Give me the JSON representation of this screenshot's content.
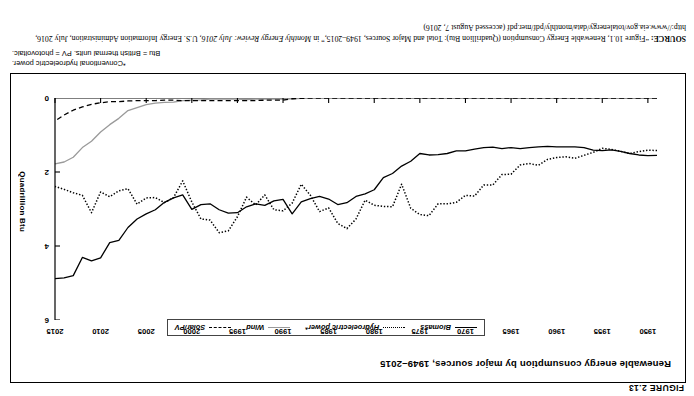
{
  "figure": {
    "number": "FIGURE 2.13"
  },
  "chart": {
    "title": "Renewable energy consumption by major sources, 1949–2015",
    "ylabel": "Quadrillion Btu",
    "legend": [
      {
        "label": "Biomass",
        "key": "solid",
        "color": "#000000"
      },
      {
        "label": "Hydroelectric power*",
        "key": "dotted",
        "color": "#000000"
      },
      {
        "label": "Wind",
        "key": "gray-solid",
        "color": "#9a9a9a"
      },
      {
        "label": "Solar/PV",
        "key": "dashed",
        "color": "#000000"
      }
    ]
  },
  "notes": {
    "line1": "*Conventional hydroelectric power.",
    "line2": "Btu = British thermal units. PV = photovoltaic."
  },
  "source": {
    "label": "SOURCE:",
    "text_1": " “Figure 10.1, Renewable Energy Consumption (Quadrillion Btu): Total and Major Sources, 1949–2015,” in ",
    "italic_1": "Monthly Energy Review: July 2016",
    "text_2": ", U.S. Energy Information Administration, July 2016, http://www.eia.gov/totalenergy/data/monthly/pdf/mer.pdf (accessed August 7, 2016)"
  },
  "chart_data": {
    "type": "line",
    "title": "Renewable energy consumption by major sources, 1949–2015",
    "xlabel": "",
    "ylabel": "Quadrillion Btu",
    "xlim": [
      1949,
      2015
    ],
    "ylim": [
      0,
      6
    ],
    "yticks": [
      0,
      2,
      4,
      6
    ],
    "xticks": [
      1950,
      1955,
      1960,
      1965,
      1970,
      1975,
      1980,
      1985,
      1990,
      1995,
      2000,
      2005,
      2010,
      2015
    ],
    "grid": false,
    "legend_position": "top-center",
    "x": [
      1949,
      1950,
      1951,
      1952,
      1953,
      1954,
      1955,
      1956,
      1957,
      1958,
      1959,
      1960,
      1961,
      1962,
      1963,
      1964,
      1965,
      1966,
      1967,
      1968,
      1969,
      1970,
      1971,
      1972,
      1973,
      1974,
      1975,
      1976,
      1977,
      1978,
      1979,
      1980,
      1981,
      1982,
      1983,
      1984,
      1985,
      1986,
      1987,
      1988,
      1989,
      1990,
      1991,
      1992,
      1993,
      1994,
      1995,
      1996,
      1997,
      1998,
      1999,
      2000,
      2001,
      2002,
      2003,
      2004,
      2005,
      2006,
      2007,
      2008,
      2009,
      2010,
      2011,
      2012,
      2013,
      2014,
      2015
    ],
    "series": [
      {
        "name": "Biomass",
        "style": "solid",
        "color": "#000000",
        "values": [
          1.55,
          1.56,
          1.54,
          1.5,
          1.44,
          1.4,
          1.42,
          1.41,
          1.34,
          1.32,
          1.32,
          1.32,
          1.31,
          1.32,
          1.34,
          1.37,
          1.34,
          1.37,
          1.33,
          1.34,
          1.38,
          1.43,
          1.43,
          1.5,
          1.53,
          1.54,
          1.5,
          1.71,
          1.84,
          2.04,
          2.15,
          2.48,
          2.59,
          2.66,
          2.83,
          2.88,
          2.73,
          2.66,
          2.72,
          2.81,
          3.13,
          2.74,
          2.78,
          2.9,
          2.86,
          2.94,
          3.1,
          3.11,
          3.02,
          2.86,
          2.88,
          3.01,
          2.62,
          2.7,
          2.82,
          3.02,
          3.13,
          3.27,
          3.5,
          3.85,
          3.91,
          4.32,
          4.4,
          4.31,
          4.8,
          4.86,
          4.88
        ]
      },
      {
        "name": "Hydroelectric power*",
        "style": "dotted",
        "color": "#000000",
        "values": [
          1.42,
          1.41,
          1.45,
          1.5,
          1.44,
          1.39,
          1.36,
          1.47,
          1.55,
          1.63,
          1.59,
          1.61,
          1.66,
          1.82,
          1.77,
          1.81,
          2.06,
          2.07,
          2.35,
          2.35,
          2.65,
          2.63,
          2.82,
          2.86,
          2.86,
          3.18,
          3.15,
          2.98,
          2.33,
          2.94,
          2.93,
          2.9,
          2.76,
          3.27,
          3.53,
          3.39,
          2.97,
          3.07,
          2.63,
          2.33,
          2.84,
          3.05,
          3.02,
          2.62,
          2.89,
          2.68,
          3.21,
          3.59,
          3.64,
          3.3,
          3.27,
          2.81,
          2.24,
          2.69,
          2.83,
          2.69,
          2.7,
          2.87,
          2.45,
          2.51,
          2.67,
          2.54,
          3.1,
          2.63,
          2.56,
          2.47,
          2.39
        ]
      },
      {
        "name": "Wind",
        "style": "solid",
        "color": "#9a9a9a",
        "values": [
          0,
          0,
          0,
          0,
          0,
          0,
          0,
          0,
          0,
          0,
          0,
          0,
          0,
          0,
          0,
          0,
          0,
          0,
          0,
          0,
          0,
          0,
          0,
          0,
          0,
          0,
          0,
          0,
          0,
          0,
          0,
          0,
          0,
          0,
          0.0,
          0.01,
          0.01,
          0.01,
          0.01,
          0.01,
          0.02,
          0.03,
          0.03,
          0.03,
          0.03,
          0.04,
          0.03,
          0.03,
          0.03,
          0.03,
          0.05,
          0.06,
          0.07,
          0.11,
          0.12,
          0.14,
          0.18,
          0.26,
          0.34,
          0.55,
          0.72,
          0.92,
          1.17,
          1.34,
          1.6,
          1.73,
          1.78
        ]
      },
      {
        "name": "Solar/PV",
        "style": "dashed",
        "color": "#000000",
        "values": [
          0,
          0,
          0,
          0,
          0,
          0,
          0,
          0,
          0,
          0,
          0,
          0,
          0,
          0,
          0,
          0,
          0,
          0,
          0,
          0,
          0,
          0,
          0,
          0,
          0,
          0,
          0,
          0,
          0,
          0,
          0,
          0,
          0,
          0,
          0.0,
          0.0,
          0.0,
          0.0,
          0.0,
          0.01,
          0.02,
          0.06,
          0.06,
          0.06,
          0.07,
          0.07,
          0.07,
          0.07,
          0.07,
          0.07,
          0.07,
          0.07,
          0.07,
          0.06,
          0.06,
          0.07,
          0.07,
          0.07,
          0.08,
          0.1,
          0.1,
          0.13,
          0.17,
          0.24,
          0.33,
          0.46,
          0.62
        ]
      }
    ]
  }
}
